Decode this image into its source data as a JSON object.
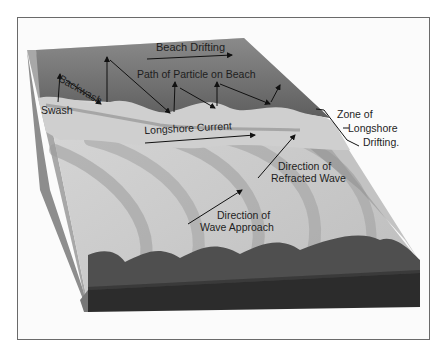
{
  "diagram": {
    "labels": {
      "beach_drifting": "Beach Drifting",
      "path_of_particle": "Path of Particle on Beach",
      "backwash": "Backwash",
      "swash": "Swash",
      "longshore_current": "Longshore Current",
      "zone_line1": "Zone of",
      "zone_line2": "Longshore",
      "zone_line3": "Drifting.",
      "refracted_line1": "Direction of",
      "refracted_line2": "Refracted Wave",
      "approach_line1": "Direction of",
      "approach_line2": "Wave Approach"
    },
    "colors": {
      "beach": "#7a7a7a",
      "surf": "#b9b9b9",
      "waves": "#d2d2d2",
      "wave_shadow": "#9a9a9a",
      "block_side_upper": "#4a4a4a",
      "block_side_lower": "#2c2c2c",
      "frame": "#6a6a6a",
      "text": "#1e1e1e"
    }
  }
}
